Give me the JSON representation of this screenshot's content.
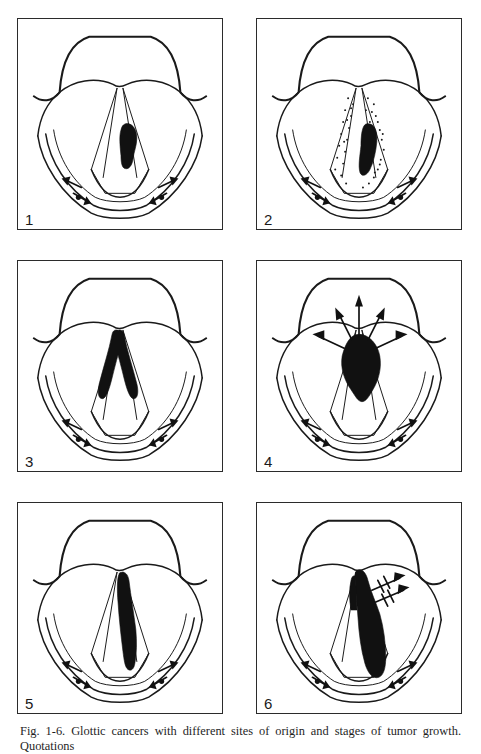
{
  "figure": {
    "label": "Fig. 1-6.",
    "caption": "Fig. 1-6. Glottic cancers with different sites of origin and stages of tumor growth. Quotations",
    "caption_visible_line": "Fig. 1-6. Glottic cancers with different sites of origin and stages of tumor growth. Quotations",
    "panel_count": 6,
    "view": "laryngoscopic view of the larynx"
  },
  "colors": {
    "ink": "#1a1a1a",
    "tumor": "#111111",
    "frame": "#2b2b2b",
    "page_background": "#ffffff"
  },
  "panels": [
    {
      "number": "1",
      "name": "panel-1",
      "description": "Small glottic tumor on mid right vocal cord",
      "tumor_site": "mid right vocal cord",
      "stage": "small, confined to cord",
      "has_stippling": false,
      "spread_arrows": 0,
      "lymphatic_arrow_pairs": 2
    },
    {
      "number": "2",
      "name": "panel-2",
      "description": "Tumor on right vocal cord with stippled (involved) cords",
      "tumor_site": "right vocal cord, posterior third",
      "stage": "cord involvement with surrounding stippled mucosa",
      "has_stippling": true,
      "spread_arrows": 0,
      "lymphatic_arrow_pairs": 2
    },
    {
      "number": "3",
      "name": "panel-3",
      "description": "Anterior commissure tumor in V shape crossing both cords",
      "tumor_site": "anterior commissure, both cords",
      "stage": "bilateral anterior involvement",
      "has_stippling": false,
      "spread_arrows": 0,
      "lymphatic_arrow_pairs": 2
    },
    {
      "number": "4",
      "name": "panel-4",
      "description": "Bulky anterior commissure tumor with radiating spread arrows",
      "tumor_site": "anterior commissure, supraglottic extension",
      "stage": "advanced with multidirectional spread",
      "has_stippling": false,
      "spread_arrows": 5,
      "lymphatic_arrow_pairs": 2
    },
    {
      "number": "5",
      "name": "panel-5",
      "description": "Extensive tumor along the full length of the right vocal cord",
      "tumor_site": "entire right vocal cord",
      "stage": "whole-cord involvement",
      "has_stippling": false,
      "spread_arrows": 0,
      "lymphatic_arrow_pairs": 2
    },
    {
      "number": "6",
      "name": "panel-6",
      "description": "Extensive transglottic tumor with lateral spread arrows",
      "tumor_site": "right cord extending to ventricle and subglottis",
      "stage": "transglottic with lateral extension",
      "has_stippling": false,
      "spread_arrows": 2,
      "lymphatic_arrow_pairs": 2
    }
  ]
}
